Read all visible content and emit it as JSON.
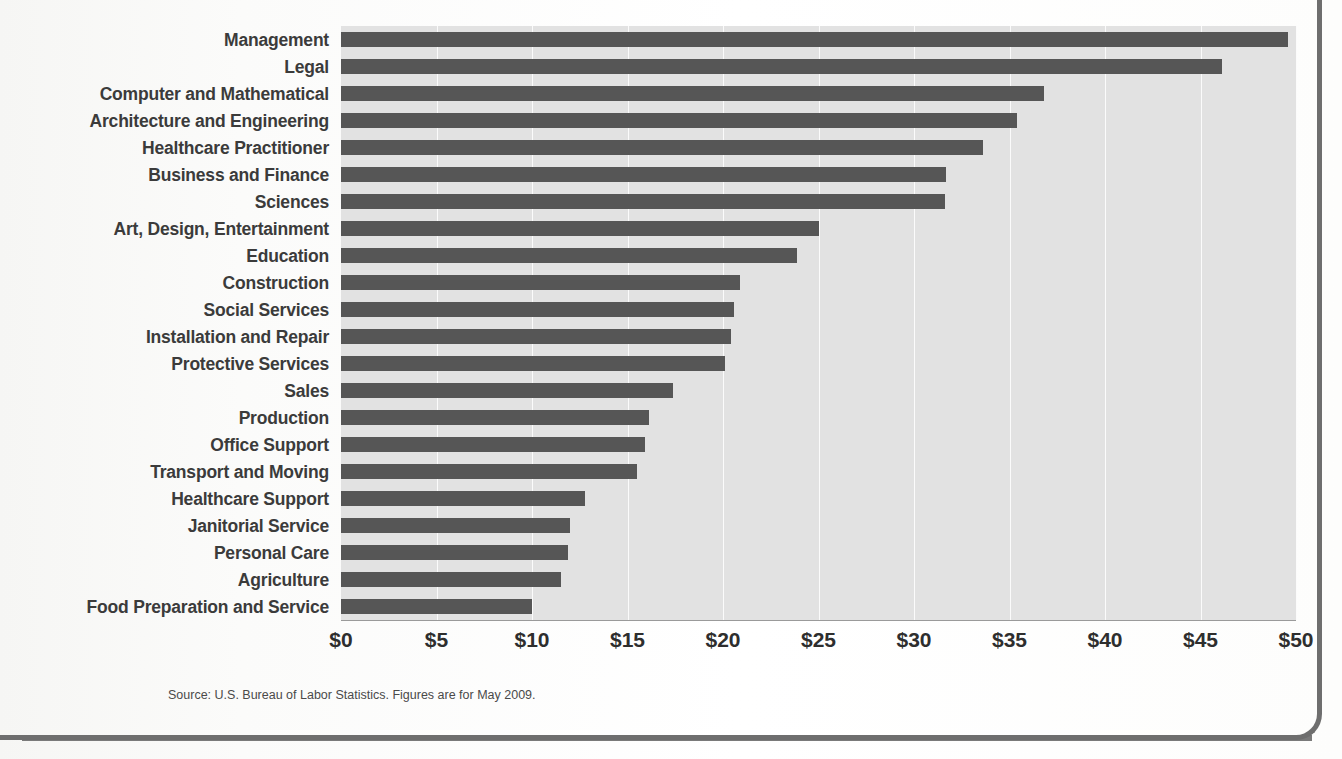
{
  "page": {
    "source_note": "Source: U.S. Bureau of Labor Statistics. Figures are for May 2009."
  },
  "colors": {
    "bar": "#565656",
    "plot_background": "#e2e2e2",
    "gridline": "#fbfbfb",
    "axis": "#9a9a9a",
    "label_text": "#3b3b3b",
    "frame": "#6e6e6e"
  },
  "chart_data": {
    "type": "bar",
    "orientation": "horizontal",
    "title": "",
    "subtitle": "",
    "xlabel": "",
    "ylabel": "",
    "xlim": [
      0,
      50
    ],
    "grid": true,
    "legend": false,
    "tick_labels": [
      "$0",
      "$5",
      "$10",
      "$15",
      "$20",
      "$25",
      "$30",
      "$35",
      "$40",
      "$45",
      "$50"
    ],
    "tick_values": [
      0,
      5,
      10,
      15,
      20,
      25,
      30,
      35,
      40,
      45,
      50
    ],
    "categories": [
      "Management",
      "Legal",
      "Computer and Mathematical",
      "Architecture and Engineering",
      "Healthcare Practitioner",
      "Business and Finance",
      "Sciences",
      "Art, Design, Entertainment",
      "Education",
      "Construction",
      "Social Services",
      "Installation and Repair",
      "Protective Services",
      "Sales",
      "Production",
      "Office Support",
      "Transport and Moving",
      "Healthcare Support",
      "Janitorial Service",
      "Personal Care",
      "Agriculture",
      "Food Preparation and Service"
    ],
    "values": [
      49.6,
      46.1,
      36.8,
      35.4,
      33.6,
      31.7,
      31.6,
      25.0,
      23.9,
      20.9,
      20.6,
      20.4,
      20.1,
      17.4,
      16.1,
      15.9,
      15.5,
      12.8,
      12.0,
      11.9,
      11.5,
      10.0
    ],
    "units": "US dollars per hour"
  }
}
